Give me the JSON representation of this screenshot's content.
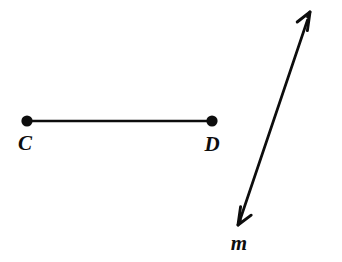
{
  "figure": {
    "background_color": "#ffffff",
    "ink_color": "#0d0d0d",
    "width": 342,
    "height": 262,
    "segment": {
      "name": "segment-cd",
      "stroke_width": 2.6,
      "endpoints": [
        {
          "label": "C",
          "point_name": "point-c",
          "x": 27,
          "y": 121,
          "dot_radius": 5.6,
          "label_x": 25,
          "label_y": 150
        },
        {
          "label": "D",
          "point_name": "point-d",
          "x": 212,
          "y": 121,
          "dot_radius": 5.6,
          "label_x": 212,
          "label_y": 151
        }
      ]
    },
    "line": {
      "name": "line-m",
      "label": "m",
      "stroke_width": 2.6,
      "arrowheads": "both",
      "from_x": 238,
      "from_y": 225,
      "to_x": 310,
      "to_y": 12,
      "label_x": 239,
      "label_y": 250
    }
  }
}
